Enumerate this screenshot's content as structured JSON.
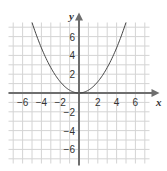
{
  "chart_data": {
    "type": "line",
    "title": "",
    "xlabel": "x",
    "ylabel": "y",
    "xlim": [
      -7.5,
      7.5
    ],
    "ylim": [
      -7.5,
      7.5
    ],
    "grid": true,
    "x_ticks": [
      -6,
      -4,
      -2,
      2,
      4,
      6
    ],
    "y_ticks": [
      6,
      4,
      2,
      -2,
      -4,
      -6
    ],
    "x_tick_labels": [
      "−6",
      "−4",
      "−2",
      "2",
      "4",
      "6"
    ],
    "y_tick_labels": [
      "6",
      "4",
      "2",
      "−2",
      "−4",
      "−6"
    ],
    "series": [
      {
        "name": "y = 0.3x²",
        "x": [
          -5,
          -4,
          -3,
          -2,
          -1,
          0,
          1,
          2,
          3,
          4,
          5
        ],
        "y": [
          7.5,
          4.8,
          2.7,
          1.2,
          0.3,
          0,
          0.3,
          1.2,
          2.7,
          4.8,
          7.5
        ]
      }
    ],
    "colors": {
      "grid": "#d4d4d4",
      "axes": "#6e6e6e",
      "curve": "#444444"
    }
  }
}
